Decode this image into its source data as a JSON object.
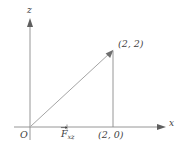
{
  "figure": {
    "type": "geometry-diagram",
    "background_color": "#ffffff",
    "line_color": "#6f6f6f",
    "text_color": "#3f3f3f",
    "axes": {
      "horizontal": {
        "name": "x-axis",
        "label": "x",
        "arrow": "right",
        "origin_px": [
          30,
          127
        ],
        "end_px": [
          166,
          127
        ]
      },
      "vertical": {
        "name": "z-axis",
        "label": "z",
        "arrow": "up",
        "origin_px": [
          30,
          127
        ],
        "end_px": [
          30,
          18
        ]
      }
    },
    "origin": {
      "label": "O",
      "px": [
        30,
        127
      ]
    },
    "points": [
      {
        "name": "apex",
        "label": "(2, 2)",
        "px": [
          113,
          50
        ]
      },
      {
        "name": "foot",
        "label": "(2, 0)",
        "px": [
          113,
          127
        ]
      }
    ],
    "vectors": [
      {
        "name": "resultant-force",
        "label_base": "F",
        "label_sub": "xz",
        "has_vector_arrow": true,
        "from_px": [
          30,
          127
        ],
        "to_px": [
          113,
          50
        ]
      }
    ],
    "tick_marks": [
      {
        "name": "force-tick",
        "axis": "x",
        "px": [
          67,
          127
        ]
      }
    ],
    "segments": [
      {
        "name": "hypotenuse",
        "from_px": [
          30,
          127
        ],
        "to_px": [
          113,
          50
        ],
        "arrow_head": true
      },
      {
        "name": "vertical-leg",
        "from_px": [
          113,
          50
        ],
        "to_px": [
          113,
          127
        ],
        "arrow_head": false
      }
    ]
  }
}
